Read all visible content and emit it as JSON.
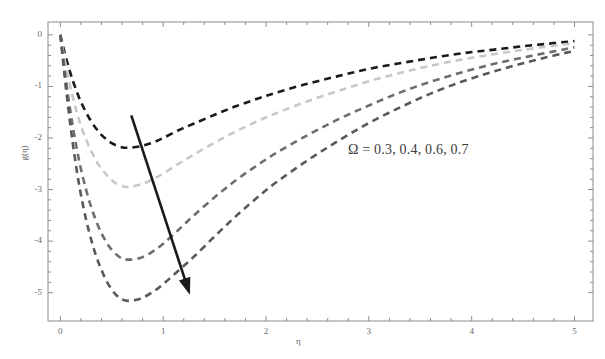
{
  "chart_data": {
    "type": "line",
    "title": "",
    "subtitle": "",
    "xlabel": "η",
    "ylabel": "g(η)",
    "xlim": [
      -0.12,
      5.18
    ],
    "ylim": [
      -5.55,
      0.25
    ],
    "xticks": [
      0,
      1,
      2,
      3,
      4,
      5
    ],
    "xtick_labels": [
      "0",
      "1",
      "2",
      "3",
      "4",
      "5"
    ],
    "yticks": [
      0,
      -1,
      -2,
      -3,
      -4,
      -5
    ],
    "ytick_labels": [
      "0",
      "-1",
      "-2",
      "-3",
      "-4",
      "-5"
    ],
    "grid": false,
    "legend_position": "inside-right",
    "minor_ticks": true,
    "frame": true,
    "annotations": [
      {
        "name": "omega-values-label",
        "text": "Ω = 0.3, 0.4, 0.6, 0.7",
        "x": 2.72,
        "y": -2.55
      },
      {
        "name": "trend-arrow",
        "type": "arrow",
        "x_start": 0.69,
        "y_start": -1.56,
        "x_end": 1.26,
        "y_end": -5.04,
        "color": "#1a1a1a"
      }
    ],
    "series": [
      {
        "name": "Ω = 0.3",
        "omega": 0.3,
        "color": "#1a1a1a",
        "dash": "dashed",
        "minimum": {
          "x": 0.63,
          "y": -2.19
        },
        "x": [
          0.0,
          0.04,
          0.08,
          0.12,
          0.16,
          0.2,
          0.25,
          0.3,
          0.35,
          0.4,
          0.45,
          0.5,
          0.55,
          0.6,
          0.63,
          0.7,
          0.8,
          0.9,
          1.0,
          1.15,
          1.3,
          1.5,
          1.7,
          1.9,
          2.1,
          2.4,
          2.7,
          3.0,
          3.3,
          3.6,
          3.9,
          4.2,
          4.5,
          4.8,
          5.0
        ],
        "y": [
          0.0,
          -0.33,
          -0.62,
          -0.88,
          -1.1,
          -1.3,
          -1.5,
          -1.68,
          -1.82,
          -1.94,
          -2.03,
          -2.1,
          -2.15,
          -2.18,
          -2.19,
          -2.185,
          -2.15,
          -2.09,
          -2.0,
          -1.85,
          -1.72,
          -1.55,
          -1.39,
          -1.25,
          -1.12,
          -0.95,
          -0.8,
          -0.66,
          -0.55,
          -0.45,
          -0.36,
          -0.29,
          -0.22,
          -0.16,
          -0.12
        ]
      },
      {
        "name": "Ω = 0.4",
        "omega": 0.4,
        "color": "#c8c8c8",
        "dash": "dashed",
        "minimum": {
          "x": 0.64,
          "y": -2.95
        },
        "x": [
          0.0,
          0.04,
          0.08,
          0.12,
          0.16,
          0.2,
          0.25,
          0.3,
          0.35,
          0.4,
          0.45,
          0.5,
          0.55,
          0.6,
          0.64,
          0.7,
          0.8,
          0.9,
          1.0,
          1.15,
          1.3,
          1.5,
          1.7,
          1.9,
          2.1,
          2.4,
          2.7,
          3.0,
          3.3,
          3.6,
          3.9,
          4.2,
          4.5,
          4.8,
          5.0
        ],
        "y": [
          0.0,
          -0.45,
          -0.85,
          -1.2,
          -1.5,
          -1.76,
          -2.03,
          -2.25,
          -2.45,
          -2.6,
          -2.72,
          -2.82,
          -2.89,
          -2.93,
          -2.95,
          -2.94,
          -2.89,
          -2.8,
          -2.69,
          -2.5,
          -2.32,
          -2.09,
          -1.88,
          -1.69,
          -1.52,
          -1.29,
          -1.09,
          -0.9,
          -0.74,
          -0.6,
          -0.48,
          -0.38,
          -0.29,
          -0.21,
          -0.16
        ]
      },
      {
        "name": "Ω = 0.6",
        "omega": 0.6,
        "color": "#6e6e6e",
        "dash": "dashed",
        "minimum": {
          "x": 0.65,
          "y": -4.36
        },
        "x": [
          0.0,
          0.04,
          0.08,
          0.12,
          0.16,
          0.2,
          0.25,
          0.3,
          0.35,
          0.4,
          0.45,
          0.5,
          0.55,
          0.6,
          0.65,
          0.72,
          0.8,
          0.9,
          1.0,
          1.15,
          1.3,
          1.5,
          1.7,
          1.9,
          2.1,
          2.4,
          2.7,
          3.0,
          3.3,
          3.6,
          3.9,
          4.2,
          4.5,
          4.8,
          5.0
        ],
        "y": [
          0.0,
          -0.65,
          -1.24,
          -1.76,
          -2.21,
          -2.6,
          -3.0,
          -3.34,
          -3.62,
          -3.85,
          -4.03,
          -4.17,
          -4.27,
          -4.34,
          -4.36,
          -4.35,
          -4.31,
          -4.2,
          -4.05,
          -3.78,
          -3.5,
          -3.15,
          -2.83,
          -2.55,
          -2.29,
          -1.95,
          -1.64,
          -1.37,
          -1.12,
          -0.91,
          -0.73,
          -0.57,
          -0.44,
          -0.32,
          -0.24
        ]
      },
      {
        "name": "Ω = 0.7",
        "omega": 0.7,
        "color": "#595959",
        "dash": "dashed",
        "minimum": {
          "x": 0.66,
          "y": -5.16
        },
        "x": [
          0.0,
          0.04,
          0.08,
          0.12,
          0.16,
          0.2,
          0.25,
          0.3,
          0.35,
          0.4,
          0.45,
          0.5,
          0.55,
          0.6,
          0.66,
          0.74,
          0.82,
          0.92,
          1.02,
          1.15,
          1.3,
          1.5,
          1.7,
          1.9,
          2.1,
          2.4,
          2.7,
          3.0,
          3.3,
          3.6,
          3.9,
          4.2,
          4.5,
          4.8,
          5.0
        ],
        "y": [
          0.0,
          -0.77,
          -1.47,
          -2.09,
          -2.63,
          -3.1,
          -3.58,
          -3.97,
          -4.3,
          -4.56,
          -4.78,
          -4.94,
          -5.06,
          -5.13,
          -5.16,
          -5.14,
          -5.08,
          -4.96,
          -4.8,
          -4.57,
          -4.3,
          -3.91,
          -3.53,
          -3.18,
          -2.86,
          -2.44,
          -2.06,
          -1.71,
          -1.41,
          -1.14,
          -0.91,
          -0.72,
          -0.55,
          -0.4,
          -0.31
        ]
      }
    ]
  },
  "plot_area": {
    "left": 48,
    "top": 22,
    "right": 593,
    "bottom": 321
  }
}
